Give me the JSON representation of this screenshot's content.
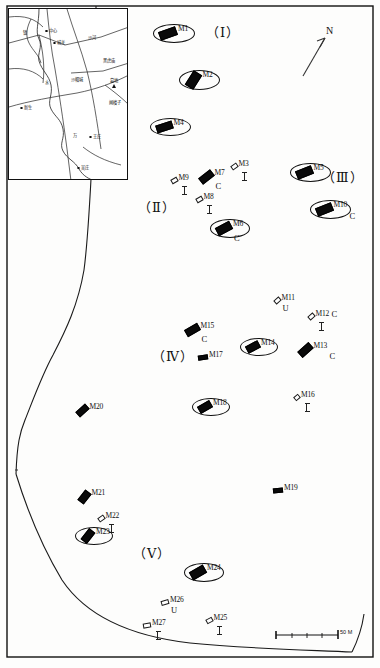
{
  "figure": {
    "type": "archaeological-site-distribution-map",
    "north_arrow_label": "N",
    "scale_bar_label": "50 M"
  },
  "groups": [
    {
      "id": "group-1",
      "label": "（Ⅰ）",
      "x": 206,
      "y": 22
    },
    {
      "id": "group-2",
      "label": "（Ⅱ）",
      "x": 138,
      "y": 197
    },
    {
      "id": "group-3",
      "label": "（Ⅲ）",
      "x": 322,
      "y": 167
    },
    {
      "id": "group-4",
      "label": "（Ⅳ）",
      "x": 152,
      "y": 346
    },
    {
      "id": "group-5",
      "label": "（Ⅴ）",
      "x": 133,
      "y": 543
    }
  ],
  "tombs": [
    {
      "id": "M1",
      "label": "M1",
      "x": 168,
      "y": 33,
      "style": "filled",
      "ellipse": true,
      "w": 18,
      "h": 9,
      "rot": -20,
      "sub": "",
      "sub_pos": "none",
      "tick": false
    },
    {
      "id": "M2",
      "label": "M2",
      "x": 193,
      "y": 80,
      "style": "filled",
      "ellipse": true,
      "w": 17,
      "h": 10,
      "rot": -58,
      "sub": "",
      "sub_pos": "none",
      "tick": false
    },
    {
      "id": "M4",
      "label": "M4",
      "x": 164,
      "y": 127,
      "style": "filled",
      "ellipse": true,
      "w": 17,
      "h": 8,
      "rot": -18,
      "sub": "",
      "sub_pos": "none",
      "tick": false
    },
    {
      "id": "M3",
      "label": "M3",
      "x": 234,
      "y": 166,
      "style": "hollow",
      "ellipse": false,
      "w": 7,
      "h": 5,
      "rot": -35,
      "sub": "",
      "sub_pos": "none",
      "tick": true
    },
    {
      "id": "M9",
      "label": "M9",
      "x": 174,
      "y": 180,
      "style": "hollow",
      "ellipse": false,
      "w": 7,
      "h": 5,
      "rot": -30,
      "sub": "",
      "sub_pos": "none",
      "tick": true
    },
    {
      "id": "M7",
      "label": "M7",
      "x": 206,
      "y": 177,
      "style": "filled",
      "ellipse": false,
      "w": 15,
      "h": 8,
      "rot": -38,
      "sub": "C",
      "sub_pos": "below",
      "tick": false
    },
    {
      "id": "M8",
      "label": "M8",
      "x": 199,
      "y": 199,
      "style": "hollow",
      "ellipse": false,
      "w": 7,
      "h": 5,
      "rot": -30,
      "sub": "",
      "sub_pos": "none",
      "tick": true
    },
    {
      "id": "M6",
      "label": "M6",
      "x": 224,
      "y": 228,
      "style": "filled",
      "ellipse": true,
      "w": 16,
      "h": 9,
      "rot": -28,
      "sub": "C",
      "sub_pos": "below",
      "tick": false
    },
    {
      "id": "M5",
      "label": "M5",
      "x": 304,
      "y": 172,
      "style": "filled",
      "ellipse": true,
      "w": 17,
      "h": 9,
      "rot": -22,
      "sub": "",
      "sub_pos": "none",
      "tick": false
    },
    {
      "id": "M10",
      "label": "M10",
      "x": 324,
      "y": 209,
      "style": "filled",
      "ellipse": true,
      "w": 17,
      "h": 9,
      "rot": -22,
      "sub": "C",
      "sub_pos": "right-below",
      "tick": false
    },
    {
      "id": "M11",
      "label": "M11",
      "x": 277,
      "y": 300,
      "style": "hollow",
      "ellipse": false,
      "w": 7,
      "h": 5,
      "rot": -42,
      "sub": "U",
      "sub_pos": "below",
      "tick": false
    },
    {
      "id": "M12",
      "label": "M12",
      "x": 311,
      "y": 316,
      "style": "hollow",
      "ellipse": false,
      "w": 7,
      "h": 5,
      "rot": -42,
      "sub": "C",
      "sub_pos": "right",
      "tick": true
    },
    {
      "id": "M15",
      "label": "M15",
      "x": 192,
      "y": 330,
      "style": "filled",
      "ellipse": false,
      "w": 15,
      "h": 8,
      "rot": -30,
      "sub": "C",
      "sub_pos": "below",
      "tick": false
    },
    {
      "id": "M17",
      "label": "M17",
      "x": 203,
      "y": 357,
      "style": "filled",
      "ellipse": false,
      "w": 10,
      "h": 5,
      "rot": -8,
      "sub": "",
      "sub_pos": "none",
      "tick": false
    },
    {
      "id": "M14",
      "label": "M14",
      "x": 253,
      "y": 347,
      "style": "filled",
      "ellipse": true,
      "w": 14,
      "h": 8,
      "rot": -28,
      "sub": "",
      "sub_pos": "none",
      "tick": false
    },
    {
      "id": "M13",
      "label": "M13",
      "x": 305,
      "y": 350,
      "style": "filled",
      "ellipse": false,
      "w": 15,
      "h": 8,
      "rot": -42,
      "sub": "C",
      "sub_pos": "right-below",
      "tick": false
    },
    {
      "id": "M16",
      "label": "M16",
      "x": 297,
      "y": 397,
      "style": "hollow",
      "ellipse": false,
      "w": 6,
      "h": 5,
      "rot": -40,
      "sub": "",
      "sub_pos": "none",
      "tick": true
    },
    {
      "id": "M18",
      "label": "M18",
      "x": 205,
      "y": 407,
      "style": "filled",
      "ellipse": true,
      "w": 14,
      "h": 8,
      "rot": -30,
      "sub": "",
      "sub_pos": "none",
      "tick": false
    },
    {
      "id": "M20",
      "label": "M20",
      "x": 82,
      "y": 410,
      "style": "filled",
      "ellipse": false,
      "w": 13,
      "h": 7,
      "rot": -42,
      "sub": "",
      "sub_pos": "none",
      "tick": false
    },
    {
      "id": "M19",
      "label": "M19",
      "x": 278,
      "y": 490,
      "style": "filled",
      "ellipse": false,
      "w": 10,
      "h": 5,
      "rot": -6,
      "sub": "",
      "sub_pos": "none",
      "tick": false
    },
    {
      "id": "M21",
      "label": "M21",
      "x": 84,
      "y": 497,
      "style": "filled",
      "ellipse": false,
      "w": 13,
      "h": 8,
      "rot": -52,
      "sub": "",
      "sub_pos": "none",
      "tick": false
    },
    {
      "id": "M22",
      "label": "M22",
      "x": 101,
      "y": 518,
      "style": "hollow",
      "ellipse": false,
      "w": 7,
      "h": 5,
      "rot": -35,
      "sub": "",
      "sub_pos": "none",
      "tick": true
    },
    {
      "id": "M23",
      "label": "M23",
      "x": 88,
      "y": 536,
      "style": "filled",
      "ellipse": true,
      "w": 14,
      "h": 8,
      "rot": -52,
      "sub": "",
      "sub_pos": "none",
      "tick": false
    },
    {
      "id": "M24",
      "label": "M24",
      "x": 198,
      "y": 572,
      "style": "filled",
      "ellipse": true,
      "w": 16,
      "h": 9,
      "rot": -30,
      "sub": "",
      "sub_pos": "none",
      "tick": false
    },
    {
      "id": "M26",
      "label": "M26",
      "x": 165,
      "y": 602,
      "style": "hollow",
      "ellipse": false,
      "w": 8,
      "h": 5,
      "rot": -16,
      "sub": "U",
      "sub_pos": "below",
      "tick": false
    },
    {
      "id": "M25",
      "label": "M25",
      "x": 209,
      "y": 620,
      "style": "hollow",
      "ellipse": false,
      "w": 7,
      "h": 5,
      "rot": -28,
      "sub": "",
      "sub_pos": "none",
      "tick": true
    },
    {
      "id": "M27",
      "label": "M27",
      "x": 147,
      "y": 625,
      "style": "hollow",
      "ellipse": false,
      "w": 8,
      "h": 5,
      "rot": -10,
      "sub": "",
      "sub_pos": "none",
      "tick": true
    }
  ],
  "inset": {
    "title": "location-inset-map",
    "places": [
      {
        "name": "镇",
        "x": 14,
        "y": 22,
        "marker": "none"
      },
      {
        "name": "中心",
        "x": 40,
        "y": 20,
        "marker": "solid"
      },
      {
        "name": "城关",
        "x": 48,
        "y": 32,
        "marker": "open"
      },
      {
        "name": "沙河",
        "x": 79,
        "y": 27,
        "marker": "none"
      },
      {
        "name": "黑虎庙",
        "x": 94,
        "y": 50,
        "marker": "none"
      },
      {
        "name": "沙帽城",
        "x": 62,
        "y": 69,
        "marker": "none"
      },
      {
        "name": "墓地",
        "x": 101,
        "y": 70,
        "marker": "tri"
      },
      {
        "name": "闸楼子",
        "x": 100,
        "y": 92,
        "marker": "none"
      },
      {
        "name": "新生",
        "x": 15,
        "y": 97,
        "marker": "open"
      },
      {
        "name": "水",
        "x": 36,
        "y": 72,
        "marker": "none"
      },
      {
        "name": "万",
        "x": 64,
        "y": 125,
        "marker": "none"
      },
      {
        "name": "王庄",
        "x": 84,
        "y": 126,
        "marker": "open"
      },
      {
        "name": "吴庄",
        "x": 72,
        "y": 157,
        "marker": "open"
      }
    ]
  }
}
